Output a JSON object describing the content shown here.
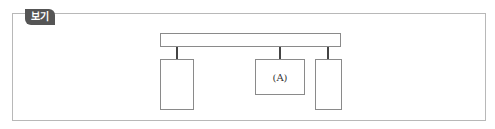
{
  "badge": {
    "label": "보기"
  },
  "diagram": {
    "top_bar": {
      "label": ""
    },
    "boxes": [
      {
        "id": "left",
        "label": ""
      },
      {
        "id": "middle",
        "label": "(A)"
      },
      {
        "id": "right",
        "label": ""
      }
    ],
    "colors": {
      "badge_bg": "#555555",
      "border": "#8a8a8a",
      "rod": "#444444"
    }
  }
}
